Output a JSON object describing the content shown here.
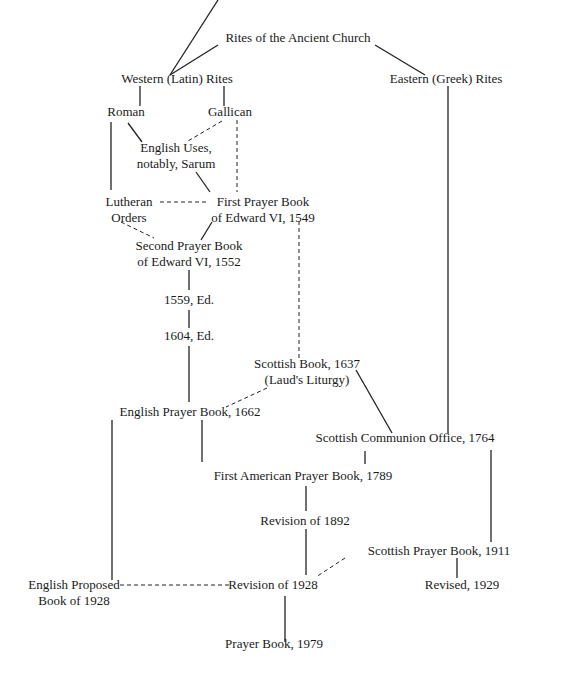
{
  "diagram": {
    "title": "Rites of the Ancient Church",
    "nodes": {
      "ancient": {
        "lines": [
          "Rites of the Ancient Church"
        ]
      },
      "western": {
        "lines": [
          "Western (Latin) Rites"
        ]
      },
      "eastern": {
        "lines": [
          "Eastern (Greek) Rites"
        ]
      },
      "roman": {
        "lines": [
          "Roman"
        ]
      },
      "gallican": {
        "lines": [
          "Gallican"
        ]
      },
      "sarum": {
        "lines": [
          "English Uses,",
          "notably, Sarum"
        ]
      },
      "lutheran": {
        "lines": [
          "Lutheran",
          "Orders"
        ]
      },
      "first1549": {
        "lines": [
          "First Prayer Book",
          "of Edward VI, 1549"
        ]
      },
      "second1552": {
        "lines": [
          "Second Prayer Book",
          "of Edward VI, 1552"
        ]
      },
      "ed1559": {
        "lines": [
          "1559, Ed."
        ]
      },
      "ed1604": {
        "lines": [
          "1604, Ed."
        ]
      },
      "scottish1637": {
        "lines": [
          "Scottish Book, 1637",
          "(Laud's Liturgy)"
        ]
      },
      "english1662": {
        "lines": [
          "English Prayer Book, 1662"
        ]
      },
      "scottish1764": {
        "lines": [
          "Scottish Communion Office, 1764"
        ]
      },
      "american1789": {
        "lines": [
          "First American Prayer Book, 1789"
        ]
      },
      "rev1892": {
        "lines": [
          "Revision of 1892"
        ]
      },
      "scottish1911": {
        "lines": [
          "Scottish Prayer Book, 1911"
        ]
      },
      "proposed1928": {
        "lines": [
          "English Proposed",
          "Book of 1928"
        ]
      },
      "rev1928": {
        "lines": [
          "Revision of 1928"
        ]
      },
      "revised1929": {
        "lines": [
          "Revised, 1929"
        ]
      },
      "pb1979": {
        "lines": [
          "Prayer Book, 1979"
        ]
      }
    },
    "edges": [
      {
        "from": "ancient",
        "to": "western",
        "style": "solid"
      },
      {
        "from": "ancient",
        "to": "eastern",
        "style": "solid"
      },
      {
        "from": "western",
        "to": "roman",
        "style": "solid"
      },
      {
        "from": "western",
        "to": "gallican",
        "style": "solid"
      },
      {
        "from": "roman",
        "to": "sarum",
        "style": "solid"
      },
      {
        "from": "gallican",
        "to": "sarum",
        "style": "dashed"
      },
      {
        "from": "roman",
        "to": "lutheran",
        "style": "solid"
      },
      {
        "from": "gallican",
        "to": "first1549",
        "style": "dashed"
      },
      {
        "from": "sarum",
        "to": "first1549",
        "style": "solid"
      },
      {
        "from": "lutheran",
        "to": "first1549",
        "style": "dashed"
      },
      {
        "from": "lutheran",
        "to": "second1552",
        "style": "dashed"
      },
      {
        "from": "first1549",
        "to": "second1552",
        "style": "solid"
      },
      {
        "from": "first1549",
        "to": "scottish1637",
        "style": "dashed"
      },
      {
        "from": "second1552",
        "to": "ed1559",
        "style": "solid"
      },
      {
        "from": "ed1559",
        "to": "ed1604",
        "style": "solid"
      },
      {
        "from": "ed1604",
        "to": "english1662",
        "style": "solid"
      },
      {
        "from": "scottish1637",
        "to": "english1662",
        "style": "dashed"
      },
      {
        "from": "scottish1637",
        "to": "scottish1764",
        "style": "solid"
      },
      {
        "from": "eastern",
        "to": "scottish1764",
        "style": "solid"
      },
      {
        "from": "english1662",
        "to": "american1789",
        "style": "solid"
      },
      {
        "from": "scottish1764",
        "to": "american1789",
        "style": "solid"
      },
      {
        "from": "english1662",
        "to": "proposed1928",
        "style": "solid"
      },
      {
        "from": "american1789",
        "to": "rev1892",
        "style": "solid"
      },
      {
        "from": "scottish1764",
        "to": "scottish1911",
        "style": "solid"
      },
      {
        "from": "rev1892",
        "to": "rev1928",
        "style": "solid"
      },
      {
        "from": "scottish1911",
        "to": "rev1928",
        "style": "dashed"
      },
      {
        "from": "proposed1928",
        "to": "rev1928",
        "style": "dashed"
      },
      {
        "from": "scottish1911",
        "to": "revised1929",
        "style": "solid"
      },
      {
        "from": "rev1928",
        "to": "pb1979",
        "style": "solid"
      }
    ]
  }
}
